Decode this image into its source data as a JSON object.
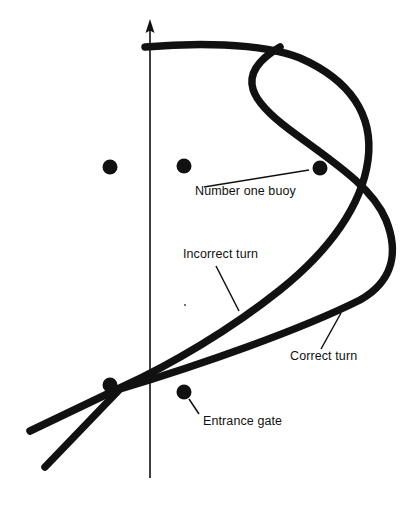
{
  "figure": {
    "kind": "navigation-diagram",
    "background_color": "#ffffff",
    "ink_color": "#000000"
  },
  "axis": {
    "name": "wind-direction-axis",
    "orientation": "vertical",
    "arrow_at": "top",
    "x": 150,
    "y_top": 20,
    "y_bottom": 478,
    "line_width": 1.6,
    "color": "#111111"
  },
  "buoys": {
    "radius": 7.5,
    "color": "#111111",
    "items": [
      {
        "name": "buoy-upper-left",
        "cx": 110,
        "cy": 167
      },
      {
        "name": "buoy-upper-middle",
        "cx": 184,
        "cy": 166
      },
      {
        "name": "buoy-number-one",
        "cx": 320,
        "cy": 168
      },
      {
        "name": "buoy-gate-left",
        "cx": 110,
        "cy": 385
      },
      {
        "name": "buoy-gate-right",
        "cx": 184,
        "cy": 392
      }
    ]
  },
  "tracks": [
    {
      "name": "correct-turn-track",
      "label": "Correct turn",
      "stroke_width": 7.5,
      "color": "#111111",
      "path": "M 45 467 L 120 389 C 200 365 300 330 360 300 C 395 280 398 250 386 220 C 372 186 330 160 290 130 C 255 104 230 76 280 47"
    },
    {
      "name": "incorrect-turn-track",
      "label": "Incorrect turn",
      "stroke_width": 7.5,
      "color": "#111111",
      "path": "M 30 431 L 122 387 C 170 365 230 330 280 290 C 330 250 362 205 368 160 C 374 115 350 80 300 58 C 260 42 190 43 145 47"
    }
  ],
  "labels": [
    {
      "name": "number-one-buoy-label",
      "text": "Number one buoy",
      "x": 195,
      "y": 195,
      "anchor": "start",
      "leader": {
        "x1": 204,
        "y1": 187,
        "x2": 309,
        "y2": 170
      }
    },
    {
      "name": "incorrect-turn-label",
      "text": "Incorrect turn",
      "x": 183,
      "y": 258,
      "anchor": "start",
      "leader": {
        "x1": 216,
        "y1": 266,
        "x2": 239,
        "y2": 311
      }
    },
    {
      "name": "correct-turn-label",
      "text": "Correct turn",
      "x": 290,
      "y": 360,
      "anchor": "start",
      "leader": {
        "x1": 321,
        "y1": 349,
        "x2": 341,
        "y2": 313
      }
    },
    {
      "name": "entrance-gate-label",
      "text": "Entrance gate",
      "x": 203,
      "y": 425,
      "anchor": "start",
      "leader": {
        "x1": 199,
        "y1": 414,
        "x2": 189,
        "y2": 399
      }
    }
  ],
  "speck": {
    "name": "print-speck",
    "cx": 185,
    "cy": 305,
    "r": 1.1
  }
}
